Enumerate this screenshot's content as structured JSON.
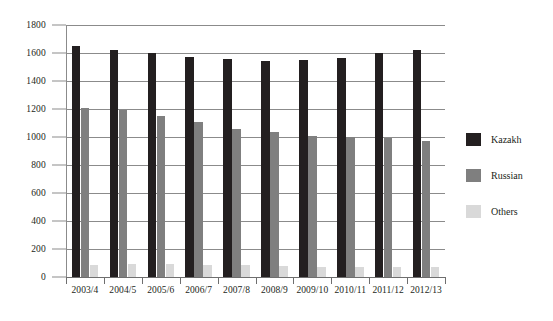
{
  "chart_data": {
    "type": "bar",
    "title": "",
    "subtitle": "",
    "xlabel": "",
    "ylabel": "",
    "ylim": [
      0,
      1800
    ],
    "ytick_step": 200,
    "yticks": [
      0,
      200,
      400,
      600,
      800,
      1000,
      1200,
      1400,
      1600,
      1800
    ],
    "ytick_labels": [
      "0",
      "200",
      "400",
      "600",
      "800",
      "1000",
      "1200",
      "1400",
      "1600",
      "1800"
    ],
    "grid": true,
    "grid_axis": "y",
    "legend_position": "right",
    "categories": [
      "2003/4",
      "2004/5",
      "2005/6",
      "2006/7",
      "2007/8",
      "2008/9",
      "2009/10",
      "2010/11",
      "2011/12",
      "2012/13"
    ],
    "series": [
      {
        "name": "Kazakh",
        "color": "#231f20",
        "values": [
          1650,
          1620,
          1600,
          1570,
          1555,
          1545,
          1550,
          1565,
          1600,
          1625
        ]
      },
      {
        "name": "Russian",
        "color": "#7f7f7f",
        "values": [
          1210,
          1190,
          1150,
          1105,
          1060,
          1035,
          1010,
          1000,
          995,
          975
        ]
      },
      {
        "name": "Others",
        "color": "#d9d9d9",
        "values": [
          85,
          90,
          90,
          88,
          85,
          82,
          72,
          68,
          75,
          70
        ]
      }
    ]
  },
  "legend": {
    "items": [
      {
        "label": "Kazakh",
        "color": "#231f20"
      },
      {
        "label": "Russian",
        "color": "#7f7f7f"
      },
      {
        "label": "Others",
        "color": "#d9d9d9"
      }
    ]
  },
  "colors": {
    "kazakh": "#231f20",
    "russian": "#7f7f7f",
    "others": "#d9d9d9",
    "grid": "#8b8b8b",
    "axis": "#6e6e6e",
    "background": "#ffffff"
  }
}
